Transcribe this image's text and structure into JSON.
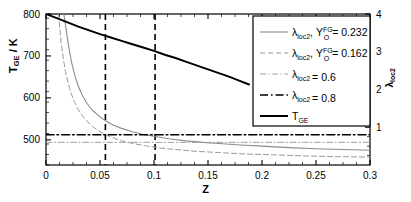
{
  "chart_data": {
    "type": "line",
    "title": "",
    "xlabel": "Z",
    "ylabel_left": "T_GE / K",
    "ylabel_right": "λ_loc2",
    "xlim": [
      0,
      0.3
    ],
    "ylim_left": [
      440,
      800
    ],
    "ylim_right": [
      0,
      4
    ],
    "grid": false,
    "legend_position": "top-right",
    "xticks": [
      0,
      0.05,
      0.1,
      0.15,
      0.2,
      0.25,
      0.3
    ],
    "xtick_labels": [
      "0",
      "0.05",
      "0.1",
      "0.15",
      "0.2",
      "0.25",
      "0.3"
    ],
    "yticks_left": [
      500,
      600,
      700,
      800
    ],
    "ytick_labels_left": [
      "500",
      "600",
      "700",
      "800"
    ],
    "yticks_right": [
      1,
      2,
      3,
      4
    ],
    "ytick_labels_right": [
      "1",
      "2",
      "3",
      "4"
    ],
    "series": [
      {
        "name": "lambda_loc2_YO_0232",
        "legend_label_parts": {
          "symbol": "λ",
          "sub": "loc2",
          "sep": ",",
          "var": "Y",
          "var_sup": "FG",
          "var_sub": "O",
          "eq": "= 0.232"
        },
        "axis": "right",
        "style": "solid",
        "color": "#8c8c8c",
        "width": 1.1,
        "x": [
          0.0165,
          0.018,
          0.02,
          0.022,
          0.024,
          0.027,
          0.03,
          0.034,
          0.038,
          0.043,
          0.048,
          0.055,
          0.062,
          0.07,
          0.08,
          0.09,
          0.1,
          0.115,
          0.13,
          0.145,
          0.16,
          0.18,
          0.2,
          0.225,
          0.25,
          0.275,
          0.3
        ],
        "y": [
          4.0,
          3.72,
          3.32,
          2.97,
          2.68,
          2.34,
          2.08,
          1.83,
          1.63,
          1.45,
          1.32,
          1.17,
          1.06,
          0.97,
          0.88,
          0.81,
          0.76,
          0.69,
          0.64,
          0.6,
          0.57,
          0.53,
          0.5,
          0.46,
          0.43,
          0.41,
          0.39
        ]
      },
      {
        "name": "lambda_loc2_YO_0162",
        "legend_label_parts": {
          "symbol": "λ",
          "sub": "loc2",
          "sep": ",",
          "var": "Y",
          "var_sup": "FG",
          "var_sub": "O",
          "eq": "= 0.162"
        },
        "axis": "right",
        "style": "dashed",
        "color": "#9a9a9a",
        "width": 1.0,
        "x": [
          0.0115,
          0.013,
          0.014,
          0.016,
          0.018,
          0.02,
          0.023,
          0.026,
          0.03,
          0.034,
          0.039,
          0.045,
          0.052,
          0.06,
          0.07,
          0.08,
          0.092,
          0.105,
          0.12,
          0.14,
          0.16,
          0.185,
          0.21,
          0.24,
          0.27,
          0.3
        ],
        "y": [
          4.0,
          3.56,
          3.25,
          2.82,
          2.48,
          2.22,
          1.92,
          1.69,
          1.46,
          1.29,
          1.13,
          0.98,
          0.85,
          0.74,
          0.64,
          0.57,
          0.51,
          0.45,
          0.41,
          0.36,
          0.33,
          0.29,
          0.27,
          0.24,
          0.22,
          0.21
        ]
      },
      {
        "name": "lambda_loc2_0.6",
        "legend_label_parts": {
          "symbol": "λ",
          "sub": "loc2",
          "eq": "= 0.6"
        },
        "axis": "right",
        "style": "dashdot",
        "color": "#a0a0a0",
        "width": 1.0,
        "constant_y": 0.6,
        "x": [
          0,
          0.3
        ],
        "y": [
          0.6,
          0.6
        ]
      },
      {
        "name": "lambda_loc2_0.8",
        "legend_label_parts": {
          "symbol": "λ",
          "sub": "loc2",
          "eq": "= 0.8"
        },
        "axis": "right",
        "style": "dashdot",
        "color": "#000000",
        "width": 1.6,
        "constant_y": 0.8,
        "x": [
          0,
          0.3
        ],
        "y": [
          0.8,
          0.8
        ]
      },
      {
        "name": "T_GE",
        "legend_label_parts": {
          "symbol": "T",
          "sub": "GE"
        },
        "axis": "left",
        "style": "solid",
        "color": "#000000",
        "width": 2.0,
        "x": [
          0,
          0.01,
          0.02,
          0.03,
          0.04,
          0.05,
          0.06,
          0.07,
          0.08,
          0.09,
          0.1,
          0.11,
          0.12,
          0.13,
          0.14,
          0.15,
          0.16,
          0.17,
          0.18,
          0.188
        ],
        "y": [
          800,
          790,
          780,
          770,
          761,
          752,
          744,
          736,
          728,
          720,
          712,
          703,
          695,
          686,
          677,
          668,
          659,
          650,
          640,
          632
        ]
      }
    ],
    "vertical_markers": [
      {
        "name": "vline-1",
        "x": 0.055,
        "style": "dashed",
        "color": "#000000",
        "width": 1.6
      },
      {
        "name": "vline-2",
        "x": 0.101,
        "style": "dashed",
        "color": "#000000",
        "width": 1.6
      }
    ]
  },
  "legend": {
    "entries": [
      {
        "label": "λloc2, YO^FG = 0.232"
      },
      {
        "label": "λloc2, YO^FG = 0.162"
      },
      {
        "label": "λloc2 = 0.6"
      },
      {
        "label": "λloc2 = 0.8"
      },
      {
        "label": "TGE"
      }
    ]
  },
  "axes": {
    "x_label": "Z",
    "y_left_sym": "T",
    "y_left_sub": "GE",
    "y_left_unit": "/ K",
    "y_right_sym": "λ",
    "y_right_sub": "loc2"
  }
}
